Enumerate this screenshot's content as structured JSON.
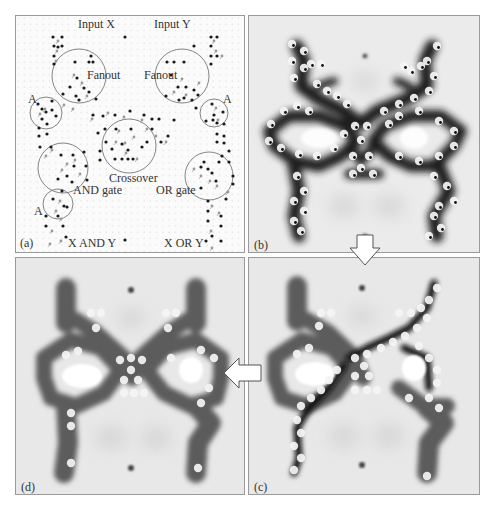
{
  "figure": {
    "panels": [
      {
        "id": "a",
        "label": "(a)"
      },
      {
        "id": "b",
        "label": "(b)"
      },
      {
        "id": "c",
        "label": "(c)"
      },
      {
        "id": "d",
        "label": "(d)"
      }
    ],
    "schematic": {
      "texts": {
        "input_x": "Input X",
        "input_y": "Input Y",
        "fanout_left": "Fanout",
        "fanout_right": "Fanout",
        "crossover": "Crossover",
        "and_gate": "AND gate",
        "or_gate": "OR gate",
        "a_top_left": "A",
        "a_top_right": "A",
        "a_bottom_left": "A",
        "output_and": "X AND Y",
        "output_or": "X OR Y"
      },
      "circles": [
        {
          "name": "fanout-left",
          "cx": 63,
          "cy": 60,
          "r": 27
        },
        {
          "name": "fanout-right",
          "cx": 166,
          "cy": 60,
          "r": 27
        },
        {
          "name": "a-top-left",
          "cx": 30,
          "cy": 97,
          "r": 16
        },
        {
          "name": "a-top-right",
          "cx": 198,
          "cy": 97,
          "r": 14
        },
        {
          "name": "crossover",
          "cx": 113,
          "cy": 130,
          "r": 27
        },
        {
          "name": "and-gate",
          "cx": 47,
          "cy": 152,
          "r": 25
        },
        {
          "name": "or-gate",
          "cx": 193,
          "cy": 160,
          "r": 24
        },
        {
          "name": "a-bottom-left",
          "cx": 42,
          "cy": 188,
          "r": 15
        }
      ],
      "dark_dots": [
        [
          37,
          21
        ],
        [
          38,
          30
        ],
        [
          38,
          40
        ],
        [
          38,
          48
        ],
        [
          109,
          21
        ],
        [
          195,
          21
        ],
        [
          195,
          30
        ],
        [
          195,
          40
        ],
        [
          195,
          48
        ],
        [
          178,
          30
        ],
        [
          201,
          21
        ],
        [
          201,
          40
        ],
        [
          46,
          21
        ],
        [
          46,
          30
        ],
        [
          42,
          31
        ],
        [
          59,
          46
        ],
        [
          73,
          46
        ],
        [
          77,
          46
        ],
        [
          151,
          46
        ],
        [
          158,
          46
        ],
        [
          168,
          46
        ],
        [
          54,
          71
        ],
        [
          61,
          62
        ],
        [
          68,
          72
        ],
        [
          73,
          76
        ],
        [
          60,
          80
        ],
        [
          80,
          83
        ],
        [
          63,
          84
        ],
        [
          47,
          78
        ],
        [
          155,
          59
        ],
        [
          162,
          71
        ],
        [
          170,
          71
        ],
        [
          178,
          74
        ],
        [
          182,
          79
        ],
        [
          163,
          84
        ],
        [
          176,
          84
        ],
        [
          168,
          82
        ],
        [
          22,
          88
        ],
        [
          26,
          93
        ],
        [
          30,
          96
        ],
        [
          26,
          103
        ],
        [
          36,
          94
        ],
        [
          40,
          100
        ],
        [
          36,
          85
        ],
        [
          180,
          92
        ],
        [
          196,
          88
        ],
        [
          207,
          96
        ],
        [
          197,
          104
        ],
        [
          190,
          105
        ],
        [
          198,
          99
        ],
        [
          23,
          112
        ],
        [
          31,
          108
        ],
        [
          31,
          118
        ],
        [
          23,
          120
        ],
        [
          24,
          131
        ],
        [
          35,
          131
        ],
        [
          201,
          118
        ],
        [
          208,
          120
        ],
        [
          201,
          126
        ],
        [
          208,
          127
        ],
        [
          201,
          107
        ],
        [
          208,
          108
        ],
        [
          100,
          113
        ],
        [
          115,
          113
        ],
        [
          96,
          133
        ],
        [
          112,
          134
        ],
        [
          106,
          128
        ],
        [
          126,
          131
        ],
        [
          99,
          143
        ],
        [
          106,
          143
        ],
        [
          112,
          143
        ],
        [
          117,
          143
        ],
        [
          136,
          113
        ],
        [
          145,
          126
        ],
        [
          131,
          126
        ],
        [
          152,
          120
        ],
        [
          158,
          104
        ],
        [
          143,
          103
        ],
        [
          136,
          103
        ],
        [
          128,
          99
        ],
        [
          114,
          95
        ],
        [
          99,
          99
        ],
        [
          87,
          100
        ],
        [
          77,
          99
        ],
        [
          89,
          113
        ],
        [
          84,
          135
        ],
        [
          82,
          117
        ],
        [
          90,
          126
        ],
        [
          84,
          144
        ],
        [
          45,
          139
        ],
        [
          57,
          139
        ],
        [
          68,
          136
        ],
        [
          70,
          150
        ],
        [
          58,
          150
        ],
        [
          51,
          160
        ],
        [
          42,
          163
        ],
        [
          56,
          166
        ],
        [
          71,
          164
        ],
        [
          188,
          146
        ],
        [
          185,
          151
        ],
        [
          192,
          153
        ],
        [
          196,
          157
        ],
        [
          185,
          172
        ],
        [
          200,
          165
        ],
        [
          217,
          168
        ],
        [
          217,
          160
        ],
        [
          210,
          183
        ],
        [
          213,
          135
        ],
        [
          206,
          140
        ],
        [
          203,
          146
        ],
        [
          213,
          146
        ],
        [
          37,
          183
        ],
        [
          46,
          175
        ],
        [
          48,
          190
        ],
        [
          42,
          200
        ],
        [
          51,
          191
        ],
        [
          30,
          200
        ],
        [
          30,
          210
        ],
        [
          47,
          210
        ],
        [
          50,
          221
        ],
        [
          192,
          185
        ],
        [
          192,
          195
        ],
        [
          192,
          205
        ],
        [
          205,
          200
        ],
        [
          205,
          210
        ],
        [
          190,
          225
        ],
        [
          196,
          220
        ],
        [
          205,
          225
        ],
        [
          109,
          224
        ],
        [
          205,
          244
        ],
        [
          31,
          248
        ],
        [
          75,
          40
        ],
        [
          150,
          80
        ]
      ],
      "grey_dots": [
        [
          42,
          25
        ],
        [
          41,
          35
        ],
        [
          40,
          45
        ],
        [
          198,
          25
        ],
        [
          200,
          35
        ],
        [
          206,
          40
        ],
        [
          58,
          59
        ],
        [
          66,
          67
        ],
        [
          71,
          80
        ],
        [
          57,
          93
        ],
        [
          48,
          89
        ],
        [
          29,
          93
        ],
        [
          24,
          98
        ],
        [
          166,
          63
        ],
        [
          158,
          76
        ],
        [
          170,
          79
        ],
        [
          183,
          67
        ],
        [
          202,
          104
        ],
        [
          200,
          92
        ],
        [
          103,
          115
        ],
        [
          109,
          127
        ],
        [
          118,
          121
        ],
        [
          110,
          137
        ],
        [
          121,
          143
        ],
        [
          100,
          126
        ],
        [
          131,
          113
        ],
        [
          140,
          120
        ],
        [
          150,
          126
        ],
        [
          126,
          104
        ],
        [
          108,
          101
        ],
        [
          92,
          97
        ],
        [
          76,
          103
        ],
        [
          51,
          148
        ],
        [
          59,
          144
        ],
        [
          64,
          158
        ],
        [
          46,
          154
        ],
        [
          36,
          134
        ],
        [
          30,
          140
        ],
        [
          185,
          160
        ],
        [
          194,
          165
        ],
        [
          201,
          170
        ],
        [
          212,
          176
        ],
        [
          178,
          153
        ],
        [
          44,
          185
        ],
        [
          40,
          195
        ],
        [
          45,
          203
        ],
        [
          36,
          215
        ],
        [
          196,
          190
        ],
        [
          203,
          197
        ],
        [
          195,
          215
        ],
        [
          196,
          232
        ],
        [
          200,
          240
        ],
        [
          45,
          225
        ],
        [
          34,
          228
        ]
      ]
    },
    "arrows": [
      {
        "name": "arrow-b-to-c",
        "direction": "down"
      },
      {
        "name": "arrow-c-to-d",
        "direction": "left"
      }
    ]
  }
}
